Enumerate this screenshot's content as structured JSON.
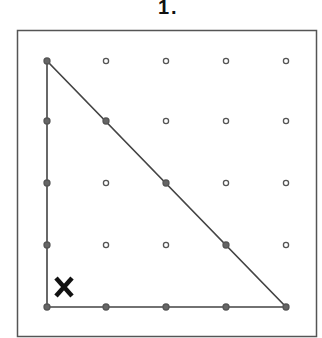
{
  "problem": {
    "label": "1.",
    "title": "Geoboard right triangle"
  },
  "geoboard": {
    "rows": 5,
    "cols": 5,
    "dot_x": [
      47,
      106,
      166,
      226,
      286
    ],
    "dot_y": [
      61,
      121,
      183,
      245,
      307
    ],
    "frame": {
      "x": 17,
      "y": 30,
      "width": 299,
      "height": 306
    }
  },
  "triangle": {
    "vertices": [
      [
        0,
        0
      ],
      [
        0,
        4
      ],
      [
        4,
        4
      ]
    ],
    "description": "Right triangle with legs along left column and bottom row"
  },
  "marker": {
    "text": "X",
    "position": "inside right-angle corner (bottom-left)"
  },
  "colors": {
    "line": "#444444",
    "dot_open": "#555555",
    "dot_filled": "#666666",
    "frame": "#555555"
  }
}
